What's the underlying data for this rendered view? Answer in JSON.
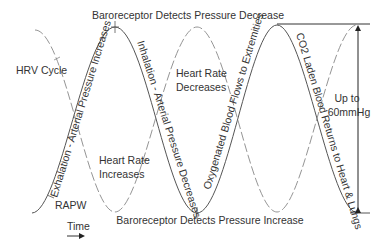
{
  "diagram": {
    "labels": {
      "top": "Baroreceptor Detects Pressure Decrease",
      "bottom": "Baroreceptor Detects Pressure Increase",
      "hrv_cycle": "HRV Cycle",
      "rapw": "RAPW",
      "time": "Time",
      "hr_decreases_1": "Heart Rate",
      "hr_decreases_2": "Decreases",
      "hr_increases_1": "Heart Rate",
      "hr_increases_2": "Increases",
      "exhalation": "Exhalation - Arterial Pressure Increases",
      "inhalation": "Inhalation - Arterial Pressure Decreases",
      "oxygenated": "Oxygenated Blood Flows to Extremities",
      "co2": "CO2 Laden Blood Returns to Heart & Lungs",
      "amplitude_1": "Up to",
      "amplitude_2": "60mmHg"
    },
    "colors": {
      "solid_curve": "#555555",
      "dashed_curve": "#888888",
      "text": "#333333",
      "arrow": "#222222"
    }
  }
}
